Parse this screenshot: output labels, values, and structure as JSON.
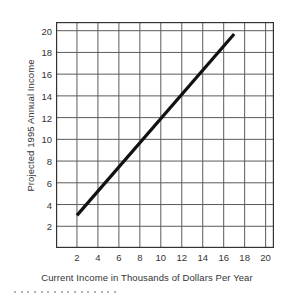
{
  "chart_data": {
    "type": "line",
    "title": "",
    "subtitle": "",
    "xlabel": "Current Income in Thousands of Dollars Per Year",
    "ylabel": "Projected 1995 Annual Income",
    "xlim": [
      0,
      20.8
    ],
    "ylim": [
      0,
      20.8
    ],
    "xticks": [
      2,
      4,
      6,
      8,
      10,
      12,
      14,
      16,
      18,
      20
    ],
    "yticks": [
      2,
      4,
      6,
      8,
      10,
      12,
      14,
      16,
      18,
      20
    ],
    "xtick_labels": [
      "2",
      "4",
      "6",
      "8",
      "10",
      "12",
      "14",
      "16",
      "18",
      "20"
    ],
    "ytick_labels": [
      "2",
      "4",
      "6",
      "8",
      "10",
      "12",
      "14",
      "16",
      "18",
      "20"
    ],
    "grid": true,
    "grid_color": "#5a5a5a",
    "legend": null,
    "legend_position": "none",
    "series": [
      {
        "name": "Projected income trend",
        "color": "#111111",
        "line_width": 3.2,
        "x": [
          2,
          17
        ],
        "y": [
          3,
          19.7
        ],
        "points": [
          {
            "x": 2,
            "y": 3
          },
          {
            "x": 4,
            "y": 5.2
          },
          {
            "x": 6,
            "y": 7.5
          },
          {
            "x": 8,
            "y": 9.7
          },
          {
            "x": 10,
            "y": 12.0
          },
          {
            "x": 12,
            "y": 14.2
          },
          {
            "x": 14,
            "y": 16.4
          },
          {
            "x": 16,
            "y": 18.6
          },
          {
            "x": 17,
            "y": 19.7
          }
        ]
      }
    ]
  },
  "figure": {
    "frame_color": "#333333",
    "background": "#ffffff",
    "artifact_dot_count": 16
  }
}
